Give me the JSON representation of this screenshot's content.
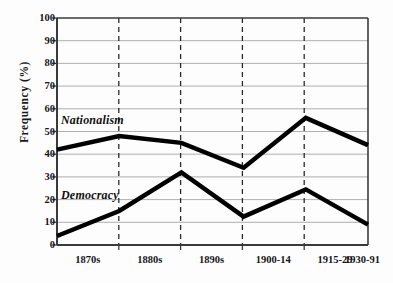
{
  "chart_data": {
    "type": "line",
    "title": "",
    "xlabel": "",
    "ylabel": "Frequency (%)",
    "categories": [
      "1870s",
      "1880s",
      "1890s",
      "1900-14",
      "1915-29",
      "1930-91"
    ],
    "ylim": [
      0,
      100
    ],
    "ytick_labels": [
      "0",
      "10",
      "20",
      "30",
      "40",
      "50",
      "60",
      "70",
      "80",
      "90",
      "100"
    ],
    "ytick_values": [
      0,
      10,
      20,
      30,
      40,
      50,
      60,
      70,
      80,
      90,
      100
    ],
    "grid": "horizontal solid gray gridlines at every 10 units; dashed vertical gridlines at 1880s, 1890s, 1900-14 and 1915-29",
    "legend": "inline labels placed next to each line",
    "series": [
      {
        "name": "Nationalism",
        "color": "#000000",
        "values": [
          42,
          48,
          45,
          34,
          56,
          44
        ]
      },
      {
        "name": "Democracy",
        "color": "#000000",
        "values": [
          4,
          15,
          32,
          12.5,
          24.5,
          9
        ]
      }
    ]
  },
  "labels": {
    "nationalism": "Nationalism",
    "democracy": "Democracy"
  },
  "caption": ""
}
